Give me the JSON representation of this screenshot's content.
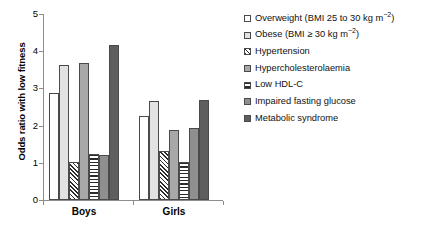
{
  "chart_data": {
    "type": "bar",
    "title": "",
    "xlabel": "",
    "ylabel": "Odds ratio with low fitness",
    "ylim": [
      0,
      5
    ],
    "yticks": [
      0,
      1,
      2,
      3,
      4,
      5
    ],
    "grid": false,
    "legend_position": "right",
    "categories": [
      "Boys",
      "Girls"
    ],
    "series": [
      {
        "name": "Overweight (BMI 25 to 30 kg m−2)",
        "pattern": "open-white",
        "values": [
          2.88,
          2.25
        ]
      },
      {
        "name": "Obese (BMI ≥ 30 kg m−2)",
        "pattern": "light-grey",
        "values": [
          3.64,
          2.67
        ]
      },
      {
        "name": "Hypertension",
        "pattern": "diagonal-hatch",
        "values": [
          1.03,
          1.32
        ]
      },
      {
        "name": "Hypercholesterolaemia",
        "pattern": "medium-grey",
        "values": [
          3.67,
          1.87
        ]
      },
      {
        "name": "Low HDL-C",
        "pattern": "horizontal-hatch",
        "values": [
          1.23,
          1.02
        ]
      },
      {
        "name": "Impaired fasting glucose",
        "pattern": "grey",
        "values": [
          1.22,
          1.93
        ]
      },
      {
        "name": "Metabolic syndrome",
        "pattern": "dark-grey",
        "values": [
          4.18,
          2.7
        ]
      }
    ]
  },
  "axis": {
    "y_label": "Odds ratio with low fitness",
    "y_ticks": [
      "0",
      "1",
      "2",
      "3",
      "4",
      "5"
    ],
    "x_group_labels": [
      "Boys",
      "Girls"
    ]
  },
  "legend": {
    "items": [
      {
        "label_html": "Overweight (BMI 25 to 30 kg m<sup>−2</sup>)",
        "label": "Overweight (BMI 25 to 30 kg m−2)",
        "swatch": "open-white-swatch"
      },
      {
        "label_html": "Obese (BMI ≥ 30 kg m<sup>−2</sup>)",
        "label": "Obese (BMI ≥ 30 kg m−2)",
        "swatch": "light-grey-swatch"
      },
      {
        "label_html": "Hypertension",
        "label": "Hypertension",
        "swatch": "diagonal-hatch-swatch"
      },
      {
        "label_html": "Hypercholesterolaemia",
        "label": "Hypercholesterolaemia",
        "swatch": "medium-grey-swatch"
      },
      {
        "label_html": "Low HDL-C",
        "label": "Low HDL-C",
        "swatch": "horizontal-hatch-swatch"
      },
      {
        "label_html": "Impaired fasting glucose",
        "label": "Impaired fasting glucose",
        "swatch": "grey-swatch"
      },
      {
        "label_html": "Metabolic syndrome",
        "label": "Metabolic syndrome",
        "swatch": "dark-grey-swatch"
      }
    ]
  },
  "colors": {
    "axis": "#8d8d8d",
    "bar_outline": "#4a4a4a",
    "open_white": "#ffffff",
    "light_grey": "#e2e2e2",
    "medium_grey": "#a8a8a8",
    "grey": "#8f8f8f",
    "dark_grey": "#5e5e5e",
    "hatch": "#2b2b2b",
    "text": "#111111",
    "background": "#ffffff"
  }
}
